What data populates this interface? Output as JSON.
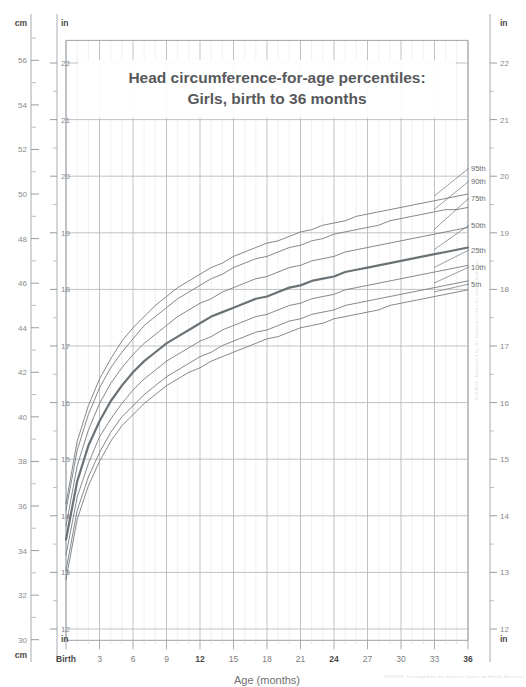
{
  "title": {
    "line1": "Head circumference-for-age percentiles:",
    "line2": "Girls, birth to 36 months"
  },
  "axes": {
    "left_top_unit_cm": "cm",
    "left_top_unit_in": "in",
    "left_bottom_unit_cm": "cm",
    "left_bottom_unit_in": "in",
    "right_top_unit_in": "in",
    "right_bottom_unit_in": "in",
    "x_title": "Age (months)",
    "cm_ticks": [
      56,
      54,
      52,
      50,
      48,
      46,
      44,
      42,
      40,
      38,
      36,
      34,
      32,
      30
    ],
    "cm_min": 30,
    "cm_max": 57,
    "in_ticks": [
      22,
      21,
      20,
      19,
      18,
      17,
      16,
      15,
      14,
      13,
      12
    ],
    "in_min": 11.8,
    "in_max": 22.4,
    "x_ticks": [
      "Birth",
      "3",
      "6",
      "9",
      "12",
      "15",
      "18",
      "21",
      "24",
      "27",
      "30",
      "33",
      "36"
    ],
    "x_bold_ticks": [
      "Birth",
      "12",
      "24",
      "36"
    ],
    "x_min": 0,
    "x_max": 36
  },
  "colors": {
    "grid": "#b9bcc0",
    "grid_minor": "#e6e8ea",
    "curve": "#6f7478",
    "curve_median": "#6b7276",
    "text_dark": "#58595b",
    "text_mid": "#7d7d7d",
    "text_light": "#9a9a9a",
    "frame": "#9fa3a7"
  },
  "percentile_labels": [
    "95th",
    "90th",
    "75th",
    "50th",
    "25th",
    "10th",
    "5th"
  ],
  "watermark": "SOURCE: Developed by the National Center for Health Statistics",
  "chart_data": {
    "type": "line",
    "xlabel": "Age (months)",
    "ylabel": "Head circumference (cm / in)",
    "xlim": [
      0,
      36
    ],
    "ylim": [
      30,
      57
    ],
    "grid": true,
    "legend": "right-edge-inline",
    "x": [
      0,
      1,
      2,
      3,
      4,
      5,
      6,
      7,
      8,
      9,
      10,
      11,
      12,
      13,
      14,
      15,
      16,
      17,
      18,
      19,
      20,
      21,
      22,
      23,
      24,
      25,
      26,
      27,
      28,
      29,
      30,
      31,
      32,
      33,
      34,
      35,
      36
    ],
    "series": [
      {
        "name": "95th",
        "values": [
          36.1,
          38.9,
          40.5,
          41.7,
          42.6,
          43.4,
          44.0,
          44.5,
          45.0,
          45.4,
          45.8,
          46.1,
          46.4,
          46.7,
          46.9,
          47.2,
          47.4,
          47.6,
          47.8,
          47.9,
          48.1,
          48.3,
          48.4,
          48.6,
          48.7,
          48.8,
          49.0,
          49.1,
          49.2,
          49.3,
          49.4,
          49.5,
          49.6,
          49.7,
          49.8,
          49.9,
          50.0
        ]
      },
      {
        "name": "90th",
        "values": [
          35.8,
          38.5,
          40.1,
          41.3,
          42.2,
          42.9,
          43.5,
          44.1,
          44.5,
          44.9,
          45.3,
          45.6,
          45.9,
          46.2,
          46.4,
          46.7,
          46.9,
          47.1,
          47.2,
          47.4,
          47.6,
          47.7,
          47.9,
          48.0,
          48.2,
          48.3,
          48.4,
          48.5,
          48.6,
          48.8,
          48.9,
          49.0,
          49.1,
          49.2,
          49.3,
          49.3,
          49.4
        ]
      },
      {
        "name": "75th",
        "values": [
          35.1,
          37.8,
          39.4,
          40.6,
          41.5,
          42.2,
          42.8,
          43.3,
          43.7,
          44.1,
          44.5,
          44.8,
          45.1,
          45.3,
          45.6,
          45.8,
          46.0,
          46.2,
          46.3,
          46.5,
          46.7,
          46.8,
          47.0,
          47.1,
          47.2,
          47.4,
          47.5,
          47.6,
          47.7,
          47.8,
          47.9,
          48.0,
          48.1,
          48.2,
          48.3,
          48.4,
          48.5
        ]
      },
      {
        "name": "50th",
        "values": [
          34.5,
          37.1,
          38.7,
          39.8,
          40.7,
          41.4,
          42.0,
          42.5,
          42.9,
          43.3,
          43.6,
          43.9,
          44.2,
          44.5,
          44.7,
          44.9,
          45.1,
          45.3,
          45.4,
          45.6,
          45.8,
          45.9,
          46.1,
          46.2,
          46.3,
          46.5,
          46.6,
          46.7,
          46.8,
          46.9,
          47.0,
          47.1,
          47.2,
          47.3,
          47.4,
          47.5,
          47.6
        ]
      },
      {
        "name": "25th",
        "values": [
          33.8,
          36.4,
          37.9,
          39.1,
          39.9,
          40.6,
          41.2,
          41.7,
          42.1,
          42.5,
          42.8,
          43.1,
          43.4,
          43.6,
          43.9,
          44.1,
          44.3,
          44.5,
          44.6,
          44.8,
          45.0,
          45.1,
          45.3,
          45.4,
          45.5,
          45.7,
          45.8,
          45.9,
          46.0,
          46.1,
          46.2,
          46.3,
          46.4,
          46.5,
          46.6,
          46.7,
          46.8
        ]
      },
      {
        "name": "10th",
        "values": [
          33.1,
          35.8,
          37.3,
          38.4,
          39.3,
          40.0,
          40.5,
          41.0,
          41.4,
          41.8,
          42.1,
          42.4,
          42.7,
          42.9,
          43.2,
          43.4,
          43.6,
          43.8,
          43.9,
          44.1,
          44.3,
          44.4,
          44.6,
          44.7,
          44.8,
          45.0,
          45.1,
          45.2,
          45.3,
          45.4,
          45.5,
          45.6,
          45.7,
          45.8,
          45.9,
          46.0,
          46.1
        ]
      },
      {
        "name": "5th",
        "values": [
          32.7,
          35.4,
          36.9,
          38.0,
          38.9,
          39.6,
          40.1,
          40.6,
          41.0,
          41.4,
          41.7,
          42.0,
          42.2,
          42.5,
          42.7,
          42.9,
          43.1,
          43.3,
          43.5,
          43.6,
          43.8,
          44.0,
          44.1,
          44.2,
          44.4,
          44.5,
          44.6,
          44.7,
          44.8,
          45.0,
          45.1,
          45.2,
          45.3,
          45.4,
          45.5,
          45.6,
          45.7
        ]
      }
    ]
  }
}
